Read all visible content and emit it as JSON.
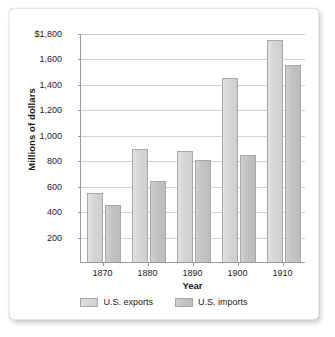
{
  "chart_data": {
    "type": "bar",
    "title": "",
    "xlabel": "Year",
    "ylabel": "Millions of dollars",
    "categories": [
      "1870",
      "1880",
      "1890",
      "1900",
      "1910"
    ],
    "series": [
      {
        "name": "U.S. exports",
        "values": [
          540,
          890,
          875,
          1450,
          1745
        ],
        "color": "#d6d6d6"
      },
      {
        "name": "U.S. imports",
        "values": [
          450,
          640,
          800,
          845,
          1550
        ],
        "color": "#c2c2c2"
      }
    ],
    "ylim": [
      0,
      1800
    ],
    "yticks": [
      200,
      400,
      600,
      800,
      1000,
      1200,
      1400,
      1600,
      1800
    ],
    "ytick_labels": [
      "200",
      "400",
      "600",
      "800",
      "1,000",
      "1,200",
      "1,400",
      "1,600",
      "$1,800"
    ],
    "grid": true,
    "legend_position": "bottom"
  }
}
